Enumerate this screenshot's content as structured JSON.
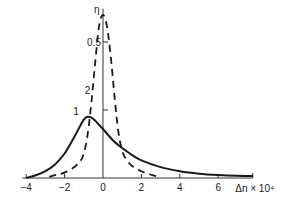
{
  "chart_data": {
    "type": "line",
    "title": "",
    "xlabel": "Δn × 10⁴",
    "ylabel": "η",
    "xlim": [
      -4,
      7.8
    ],
    "ylim": [
      0,
      0.63
    ],
    "grid": false,
    "x_ticks": [
      -4,
      -2,
      0,
      2,
      4,
      6
    ],
    "x_tick_labels": [
      "−4",
      "−2",
      "0",
      "2",
      "4",
      "6"
    ],
    "y_ticks": [
      0.25,
      0.5
    ],
    "y_tick_labels": [
      "",
      "0.5"
    ],
    "series": [
      {
        "name": "1",
        "style": "solid",
        "x": [
          -4,
          -3.5,
          -3,
          -2.5,
          -2,
          -1.5,
          -1.2,
          -1,
          -0.8,
          -0.6,
          -0.4,
          -0.2,
          0,
          0.5,
          1,
          1.5,
          2,
          3,
          4,
          5,
          6,
          7,
          7.8
        ],
        "y": [
          0.0,
          0.01,
          0.025,
          0.05,
          0.09,
          0.15,
          0.19,
          0.215,
          0.225,
          0.222,
          0.21,
          0.195,
          0.18,
          0.14,
          0.11,
          0.085,
          0.065,
          0.04,
          0.025,
          0.016,
          0.011,
          0.008,
          0.007
        ]
      },
      {
        "name": "2",
        "style": "dashed",
        "x": [
          -2.8,
          -2.4,
          -2,
          -1.6,
          -1.2,
          -1,
          -0.8,
          -0.6,
          -0.4,
          -0.2,
          0,
          0.2,
          0.4,
          0.6,
          0.8,
          1,
          1.2,
          1.5,
          2,
          2.5,
          2.9
        ],
        "y": [
          0.005,
          0.012,
          0.02,
          0.035,
          0.06,
          0.09,
          0.16,
          0.28,
          0.43,
          0.56,
          0.6,
          0.56,
          0.45,
          0.3,
          0.17,
          0.1,
          0.07,
          0.045,
          0.025,
          0.012,
          0.005
        ]
      }
    ],
    "annotations": [
      {
        "text": "1",
        "x": -1.4,
        "y": 0.23
      },
      {
        "text": "2",
        "x": -0.8,
        "y": 0.31
      }
    ]
  }
}
